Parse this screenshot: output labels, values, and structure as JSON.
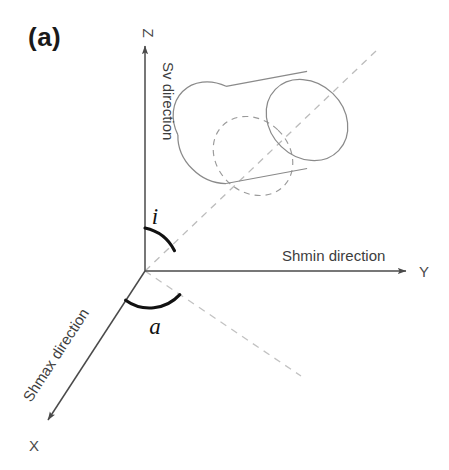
{
  "figure": {
    "panel_label": "(a)",
    "background_color": "#ffffff"
  },
  "axes": [
    {
      "key": "z",
      "tip_label": "Z",
      "caption": "Sv direction",
      "direction": "up",
      "color": "#4a4a4a"
    },
    {
      "key": "y",
      "tip_label": "Y",
      "caption": "Shmin direction",
      "direction": "right",
      "color": "#4a4a4a"
    },
    {
      "key": "x",
      "tip_label": "X",
      "caption": "Shmax direction",
      "direction": "down-left",
      "color": "#4a4a4a"
    }
  ],
  "angles": [
    {
      "key": "inclination",
      "label": "i",
      "between": "Z axis and borehole axis"
    },
    {
      "key": "azimuth",
      "label": "a",
      "between": "X axis and horizontal projection of borehole axis"
    }
  ],
  "geometry": {
    "origin": {
      "x": 145,
      "y": 271
    },
    "z_tip": {
      "x": 145,
      "y": 44
    },
    "y_tip": {
      "x": 409,
      "y": 271
    },
    "x_tip": {
      "x": 44,
      "y": 424
    },
    "borehole_axis_dashed": {
      "x1": 145,
      "y1": 271,
      "x2": 376,
      "y2": 51
    },
    "projection_dashed": {
      "x1": 145,
      "y1": 271,
      "x2": 301,
      "y2": 376
    }
  },
  "shapes": [
    {
      "name": "cylinder",
      "description": "inclined cylinder representing the borehole",
      "stroke": "#8a8a8a",
      "far_cap": "solid ellipse",
      "near_cap_hidden": "dashed ellipse"
    }
  ],
  "colors": {
    "axis_stroke": "#4a4a4a",
    "dashed_stroke": "#b9b9b9",
    "cylinder_stroke": "#8a8a8a",
    "angle_arc_stroke": "#111111",
    "text": "#3d3d3d"
  }
}
